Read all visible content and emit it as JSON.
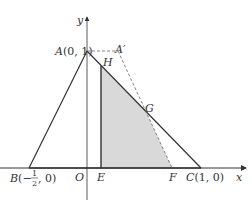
{
  "diagram": {
    "axes": {
      "x_label": "x",
      "y_label": "y",
      "origin_label": "O"
    },
    "points": {
      "A": {
        "name": "A",
        "coords": "(0, 1)"
      },
      "A_prime": {
        "name": "A′"
      },
      "H": {
        "name": "H"
      },
      "G": {
        "name": "G"
      },
      "E": {
        "name": "E"
      },
      "F": {
        "name": "F"
      },
      "B": {
        "name": "B",
        "coords_prefix": "(−",
        "frac_num": "1",
        "frac_den": "2",
        "coords_suffix": ", 0)"
      },
      "C": {
        "name": "C",
        "coords": "(1, 0)"
      }
    },
    "colors": {
      "line": "#333333",
      "shade": "#d9d9d9",
      "dashed": "#666666"
    }
  }
}
